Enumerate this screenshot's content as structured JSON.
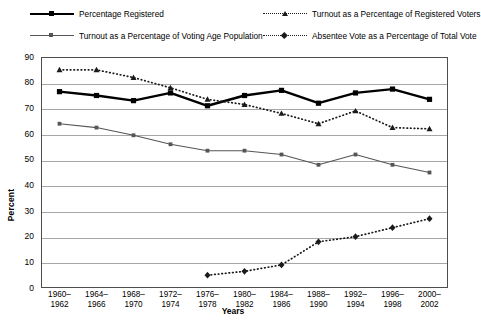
{
  "chart_data": {
    "type": "line",
    "title": "",
    "xlabel": "Years",
    "ylabel": "Percent",
    "ylim": [
      0,
      90
    ],
    "ytick_step": 10,
    "grid": true,
    "legend_position": "top",
    "categories": [
      "1960–1962",
      "1964–1966",
      "1968–1970",
      "1972–1974",
      "1976–1978",
      "1980–1982",
      "1984–1986",
      "1988–1990",
      "1992–1994",
      "1996–1998",
      "2000–2002"
    ],
    "yticks": [
      "0",
      "10",
      "20",
      "30",
      "40",
      "50",
      "60",
      "70",
      "80",
      "90"
    ],
    "series": [
      {
        "name": "Percentage Registered",
        "style": "solid-thick",
        "color": "#000000",
        "marker": "square",
        "values": [
          76.5,
          75.0,
          73.0,
          76.0,
          71.0,
          75.0,
          77.0,
          72.0,
          76.0,
          77.5,
          73.5
        ]
      },
      {
        "name": "Turnout as a Percentage of Registered Voters",
        "style": "dotted",
        "color": "#1a1a1a",
        "marker": "triangle",
        "values": [
          85.0,
          85.0,
          82.0,
          78.0,
          73.5,
          71.5,
          68.0,
          64.0,
          69.0,
          62.5,
          62.0
        ]
      },
      {
        "name": "Turnout as a Percentage of Voting Age Population",
        "style": "solid-thin",
        "color": "#555555",
        "marker": "square-small",
        "values": [
          64.0,
          62.5,
          59.5,
          56.0,
          53.5,
          53.5,
          52.0,
          48.0,
          52.0,
          48.0,
          45.0
        ]
      },
      {
        "name": "Absentee Vote as a Percentage of Total Vote",
        "style": "dotted",
        "color": "#1a1a1a",
        "marker": "diamond",
        "values": [
          null,
          null,
          null,
          null,
          5.0,
          6.5,
          9.0,
          18.0,
          20.0,
          23.5,
          27.0
        ]
      }
    ]
  },
  "legend": {
    "items": [
      {
        "label": "Percentage Registered"
      },
      {
        "label": "Turnout as a Percentage of Voting Age Population"
      },
      {
        "label": "Turnout as a Percentage of Registered Voters"
      },
      {
        "label": "Absentee Vote as a Percentage of Total Vote"
      }
    ]
  }
}
